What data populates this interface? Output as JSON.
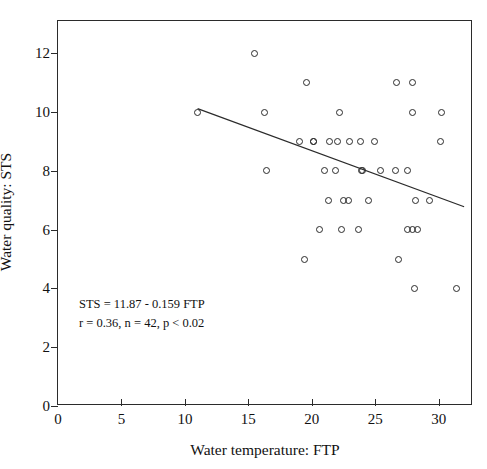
{
  "chart_data": {
    "type": "scatter",
    "title": "",
    "xlabel": "Water temperature: FTP",
    "ylabel": "Water quality: STS",
    "xlim": [
      0,
      32.7
    ],
    "ylim": [
      0,
      13.1
    ],
    "xticks": [
      0,
      5,
      10,
      15,
      20,
      25,
      30
    ],
    "yticks": [
      0,
      2,
      4,
      6,
      8,
      10,
      12
    ],
    "xtick_labels": [
      "0",
      "5",
      "10",
      "15",
      "20",
      "25",
      "30"
    ],
    "ytick_labels": [
      "0",
      "2",
      "4",
      "6",
      "8",
      "10",
      "12"
    ],
    "grid": false,
    "legend": null,
    "marker": "open-circle",
    "n_points": 42,
    "points": [
      {
        "x": 15.5,
        "y": 12
      },
      {
        "x": 19.6,
        "y": 11
      },
      {
        "x": 26.7,
        "y": 11
      },
      {
        "x": 27.9,
        "y": 11
      },
      {
        "x": 11.0,
        "y": 10
      },
      {
        "x": 16.3,
        "y": 10
      },
      {
        "x": 22.2,
        "y": 10
      },
      {
        "x": 27.9,
        "y": 10
      },
      {
        "x": 30.2,
        "y": 10
      },
      {
        "x": 19.0,
        "y": 9
      },
      {
        "x": 20.1,
        "y": 9
      },
      {
        "x": 21.4,
        "y": 9
      },
      {
        "x": 22.0,
        "y": 9
      },
      {
        "x": 23.0,
        "y": 9
      },
      {
        "x": 23.8,
        "y": 9
      },
      {
        "x": 24.9,
        "y": 9
      },
      {
        "x": 30.1,
        "y": 9
      },
      {
        "x": 16.4,
        "y": 8
      },
      {
        "x": 21.0,
        "y": 8
      },
      {
        "x": 21.9,
        "y": 8
      },
      {
        "x": 23.9,
        "y": 8
      },
      {
        "x": 25.4,
        "y": 8
      },
      {
        "x": 26.6,
        "y": 8
      },
      {
        "x": 27.5,
        "y": 8
      },
      {
        "x": 21.3,
        "y": 7
      },
      {
        "x": 22.5,
        "y": 7
      },
      {
        "x": 22.9,
        "y": 7
      },
      {
        "x": 24.5,
        "y": 7
      },
      {
        "x": 28.2,
        "y": 7
      },
      {
        "x": 29.3,
        "y": 7
      },
      {
        "x": 20.6,
        "y": 6
      },
      {
        "x": 22.3,
        "y": 6
      },
      {
        "x": 23.7,
        "y": 6
      },
      {
        "x": 27.5,
        "y": 6
      },
      {
        "x": 27.9,
        "y": 6
      },
      {
        "x": 28.3,
        "y": 6
      },
      {
        "x": 19.4,
        "y": 5
      },
      {
        "x": 26.8,
        "y": 5
      },
      {
        "x": 28.1,
        "y": 4
      },
      {
        "x": 31.4,
        "y": 4
      },
      {
        "x": 20.1,
        "y": 9
      },
      {
        "x": 24.0,
        "y": 8
      }
    ],
    "regression_line": {
      "equation": "STS = 11.87 - 0.159 FTP",
      "intercept": 11.87,
      "slope": -0.159,
      "x_start": 11.0,
      "x_end": 32.0,
      "y_start": 10.12,
      "y_end": 6.78
    },
    "annotation": {
      "line1": "STS = 11.87 - 0.159 FTP",
      "line2": "r = 0.36, n = 42, p < 0.02"
    },
    "colors": {
      "axis": "#2b2b2b",
      "marker": "#2b2b2b",
      "line": "#2b2b2b",
      "background": "#ffffff"
    }
  }
}
